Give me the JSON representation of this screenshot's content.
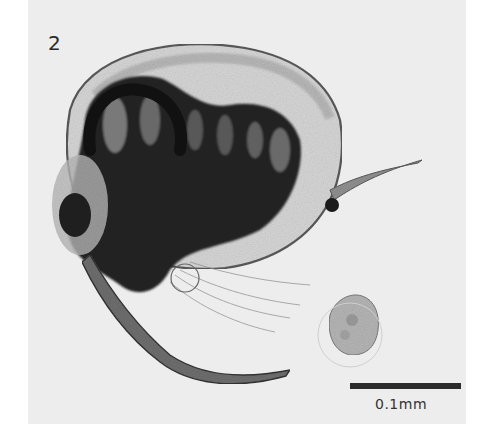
{
  "figure": {
    "panel_label": "2",
    "scale_bar": {
      "label": "0.1mm"
    },
    "colors": {
      "background": "#ededed",
      "page": "#ffffff",
      "dark_tissue": "#1e1e1e",
      "carapace_outline": "#555555"
    }
  }
}
